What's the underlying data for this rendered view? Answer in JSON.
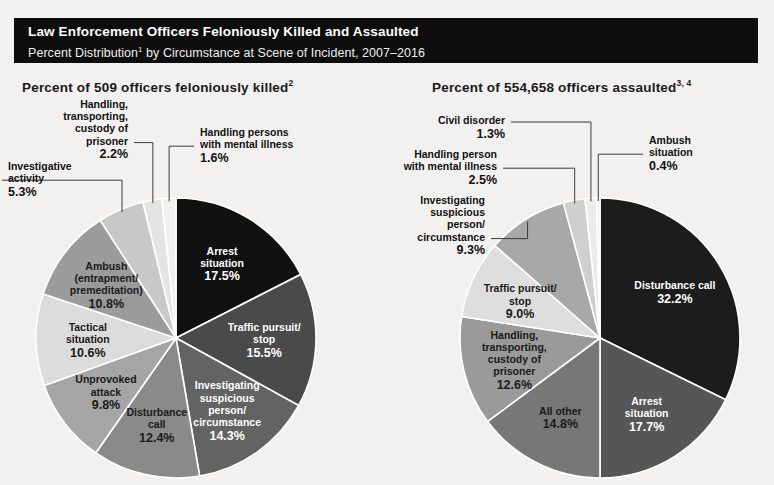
{
  "banner": {
    "title": "Law Enforcement Officers Feloniously Killed and Assaulted",
    "subtitle_pre": "Percent Distribution",
    "subtitle_sup": "1",
    "subtitle_post": " by Circumstance at Scene of Incident, 2007–2016"
  },
  "panels": {
    "left": {
      "heading_text": "Percent of 509 officers feloniously killed",
      "heading_sup": "2"
    },
    "right": {
      "heading_text": "Percent of 554,658 officers assaulted",
      "heading_sup": "3, 4"
    }
  },
  "colors": {
    "background": "#f2f1ef",
    "banner_bg": "#0d0d0d",
    "banner_text": "#ffffff",
    "heading_text": "#1a1a1a",
    "leader_line": "#3a3a3a",
    "slice_divider": "#ffffff"
  },
  "chart_data": [
    {
      "type": "pie",
      "title": "Percent of 509 officers feloniously killed",
      "id": "killed",
      "units": "percent",
      "total_label": "509 officers",
      "start_angle_deg": 0,
      "direction": "clockwise",
      "legend": "none",
      "slices": [
        {
          "label": "Arrest situation",
          "label_lines": [
            "Arrest",
            "situation"
          ],
          "value": 17.5,
          "value_text": "17.5%",
          "color": "#111111",
          "text_color": "#ffffff",
          "placement": "inside"
        },
        {
          "label": "Traffic pursuit/ stop",
          "label_lines": [
            "Traffic pursuit/",
            "stop"
          ],
          "value": 15.5,
          "value_text": "15.5%",
          "color": "#4a4a4a",
          "text_color": "#ffffff",
          "placement": "inside"
        },
        {
          "label": "Investigating suspicious person/ circumstance",
          "label_lines": [
            "Investigating",
            "suspicious",
            "person/",
            "circumstance"
          ],
          "value": 14.3,
          "value_text": "14.3%",
          "color": "#636363",
          "text_color": "#ffffff",
          "placement": "inside"
        },
        {
          "label": "Disturbance call",
          "label_lines": [
            "Disturbance",
            "call"
          ],
          "value": 12.4,
          "value_text": "12.4%",
          "color": "#8a8a8a",
          "text_color": "#1a1a1a",
          "placement": "inside"
        },
        {
          "label": "Unprovoked attack",
          "label_lines": [
            "Unprovoked",
            "attack"
          ],
          "value": 9.8,
          "value_text": "9.8%",
          "color": "#a5a5a5",
          "text_color": "#1a1a1a",
          "placement": "inside"
        },
        {
          "label": "Tactical situation",
          "label_lines": [
            "Tactical",
            "situation"
          ],
          "value": 10.6,
          "value_text": "10.6%",
          "color": "#dcdcdc",
          "text_color": "#1a1a1a",
          "placement": "inside"
        },
        {
          "label": "Ambush (entrapment/ premeditation)",
          "label_lines": [
            "Ambush",
            "(entrapment/",
            "premeditation)"
          ],
          "value": 10.8,
          "value_text": "10.8%",
          "color": "#9b9b9b",
          "text_color": "#1a1a1a",
          "placement": "inside"
        },
        {
          "label": "Investigative activity",
          "label_lines": [
            "Investigative",
            "activity"
          ],
          "value": 5.3,
          "value_text": "5.3%",
          "color": "#c8c8c8",
          "text_color": "#1a1a1a",
          "placement": "outside"
        },
        {
          "label": "Handling, transporting, custody of prisoner",
          "label_lines": [
            "Handling,",
            "transporting,",
            "custody of",
            "prisoner"
          ],
          "value": 2.2,
          "value_text": "2.2%",
          "color": "#e4e4e4",
          "text_color": "#1a1a1a",
          "placement": "outside"
        },
        {
          "label": "Handling persons with mental illness",
          "label_lines": [
            "Handling persons",
            "with mental illness"
          ],
          "value": 1.6,
          "value_text": "1.6%",
          "color": "#f0f0f0",
          "text_color": "#1a1a1a",
          "placement": "outside"
        }
      ],
      "callouts": [
        {
          "slice": "Handling, transporting, custody of prisoner",
          "lines": [
            "Handling,",
            "transporting,",
            "custody of",
            "prisoner"
          ],
          "value_text": "2.2%",
          "x": 128,
          "y": 12,
          "align": "end"
        },
        {
          "slice": "Investigative activity",
          "lines": [
            "Investigative",
            "activity"
          ],
          "value_text": "5.3%",
          "x": 8,
          "y": 74,
          "align": "start"
        },
        {
          "slice": "Handling persons with mental illness",
          "lines": [
            "Handling persons",
            "with mental illness"
          ],
          "value_text": "1.6%",
          "x": 200,
          "y": 40,
          "align": "start"
        }
      ]
    },
    {
      "type": "pie",
      "title": "Percent of 554,658 officers assaulted",
      "id": "assaulted",
      "units": "percent",
      "total_label": "554,658 officers",
      "start_angle_deg": 0,
      "direction": "clockwise",
      "legend": "none",
      "slices": [
        {
          "label": "Disturbance call",
          "label_lines": [
            "Disturbance call"
          ],
          "value": 32.2,
          "value_text": "32.2%",
          "color": "#1c1c1c",
          "text_color": "#ffffff",
          "placement": "inside"
        },
        {
          "label": "Arrest situation",
          "label_lines": [
            "Arrest",
            "situation"
          ],
          "value": 17.7,
          "value_text": "17.7%",
          "color": "#565656",
          "text_color": "#ffffff",
          "placement": "inside"
        },
        {
          "label": "All other",
          "label_lines": [
            "All other"
          ],
          "value": 14.8,
          "value_text": "14.8%",
          "color": "#777777",
          "text_color": "#1a1a1a",
          "placement": "inside"
        },
        {
          "label": "Handling, transporting, custody of prisoner",
          "label_lines": [
            "Handling,",
            "transporting,",
            "custody of",
            "prisoner"
          ],
          "value": 12.6,
          "value_text": "12.6%",
          "color": "#9a9a9a",
          "text_color": "#1a1a1a",
          "placement": "inside"
        },
        {
          "label": "Traffic pursuit/ stop",
          "label_lines": [
            "Traffic pursuit/",
            "stop"
          ],
          "value": 9.0,
          "value_text": "9.0%",
          "color": "#dedede",
          "text_color": "#1a1a1a",
          "placement": "inside"
        },
        {
          "label": "Investigating suspicious person/ circumstance",
          "label_lines": [
            "Investigating",
            "suspicious",
            "person/",
            "circumstance"
          ],
          "value": 9.3,
          "value_text": "9.3%",
          "color": "#a8a8a8",
          "text_color": "#1a1a1a",
          "placement": "outside"
        },
        {
          "label": "Handling person with mental illness",
          "label_lines": [
            "Handling person",
            "with mental illness"
          ],
          "value": 2.5,
          "value_text": "2.5%",
          "color": "#cfcfcf",
          "text_color": "#1a1a1a",
          "placement": "outside"
        },
        {
          "label": "Civil disorder",
          "label_lines": [
            "Civil disorder"
          ],
          "value": 1.3,
          "value_text": "1.3%",
          "color": "#ebebeb",
          "text_color": "#1a1a1a",
          "placement": "outside"
        },
        {
          "label": "Ambush situation",
          "label_lines": [
            "Ambush",
            "situation"
          ],
          "value": 0.4,
          "value_text": "0.4%",
          "color": "#f4f4f4",
          "text_color": "#1a1a1a",
          "placement": "outside"
        }
      ],
      "callouts": [
        {
          "slice": "Civil disorder",
          "lines": [
            "Civil disorder"
          ],
          "value_text": "1.3%",
          "x": 118,
          "y": 28,
          "align": "end"
        },
        {
          "slice": "Handling person with mental illness",
          "lines": [
            "Handling person",
            "with mental illness"
          ],
          "value_text": "2.5%",
          "x": 110,
          "y": 62,
          "align": "end"
        },
        {
          "slice": "Investigating suspicious person/ circumstance",
          "lines": [
            "Investigating",
            "suspicious",
            "person/",
            "circumstance"
          ],
          "value_text": "9.3%",
          "x": 98,
          "y": 108,
          "align": "end"
        },
        {
          "slice": "Ambush situation",
          "lines": [
            "Ambush",
            "situation"
          ],
          "value_text": "0.4%",
          "x": 262,
          "y": 48,
          "align": "start"
        }
      ]
    }
  ]
}
